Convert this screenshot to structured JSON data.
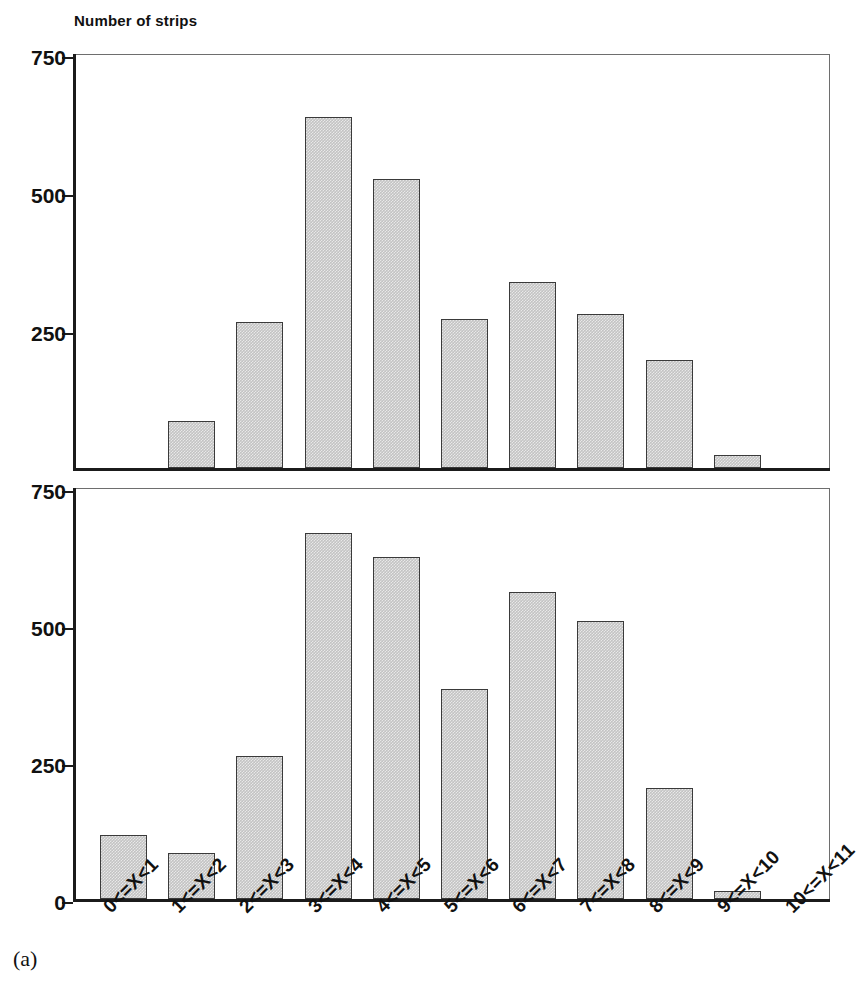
{
  "figure": {
    "caption": "(a)",
    "ylabel": "Number of strips",
    "bar_fill_color": "#c3c3c3",
    "bar_border_color": "#3a3a3a",
    "axis_color": "#1b1b1b"
  },
  "chart_data": [
    {
      "type": "bar",
      "title": "",
      "subtitle": "",
      "xlabel": "",
      "ylabel": "Number of strips",
      "categories": [
        "0<=X<1",
        "1<=X<2",
        "2<=X<3",
        "3<=X<4",
        "4<=X<5",
        "5<=X<6",
        "6<=X<7",
        "7<=X<8",
        "8<=X<9",
        "9<=X<10",
        "10<=X<11"
      ],
      "values": [
        0,
        85,
        265,
        635,
        523,
        270,
        337,
        279,
        195,
        23,
        0
      ],
      "ylim": [
        0,
        750
      ],
      "yticks": [
        250,
        500,
        750
      ],
      "yticklabels": [
        "250",
        "500",
        "750"
      ],
      "grid": false,
      "legend": "none",
      "panel": "upper"
    },
    {
      "type": "bar",
      "title": "",
      "subtitle": "",
      "xlabel": "",
      "ylabel": "",
      "categories": [
        "0<=X<1",
        "1<=X<2",
        "2<=X<3",
        "3<=X<4",
        "4<=X<5",
        "5<=X<6",
        "6<=X<7",
        "7<=X<8",
        "8<=X<9",
        "9<=X<10",
        "10<=X<11"
      ],
      "values": [
        116,
        84,
        261,
        668,
        625,
        383,
        561,
        507,
        202,
        15,
        0
      ],
      "ylim": [
        0,
        750
      ],
      "yticks": [
        0,
        250,
        500,
        750
      ],
      "yticklabels": [
        "0",
        "250",
        "500",
        "750"
      ],
      "grid": false,
      "legend": "none",
      "panel": "lower"
    }
  ]
}
